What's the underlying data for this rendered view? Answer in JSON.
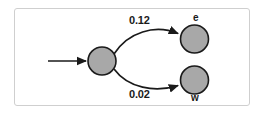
{
  "figure": {
    "title": "",
    "type": "state-transition-diagram",
    "frame": {
      "border_color": "#cfcfcf",
      "background_color": "#ffffff"
    }
  },
  "style": {
    "node_fill": "#a8a8a8",
    "node_stroke": "#1a1a1a",
    "edge_color": "#1a1a1a",
    "text_color": "#1a1a1a"
  },
  "diagram_data": {
    "nodes": [
      {
        "id": "start",
        "label": "",
        "shape": "circle",
        "cx": 102,
        "cy": 61,
        "r": 14,
        "fill": "#a8a8a8"
      },
      {
        "id": "e",
        "label": "e",
        "label_position": "above",
        "shape": "circle",
        "cx": 194.5,
        "cy": 39,
        "r": 14,
        "fill": "#a8a8a8"
      },
      {
        "id": "w",
        "label": "w",
        "label_position": "below",
        "shape": "circle",
        "cx": 194.5,
        "cy": 80,
        "r": 14,
        "fill": "#a8a8a8"
      }
    ],
    "edges": [
      {
        "id": "entry",
        "from": "",
        "to": "start",
        "label": "",
        "style": "straight-arrow"
      },
      {
        "id": "start-to-e",
        "from": "start",
        "to": "e",
        "label": "0.12",
        "label_position": "above",
        "style": "curved-arrow"
      },
      {
        "id": "start-to-w",
        "from": "start",
        "to": "w",
        "label": "0.02",
        "label_position": "below",
        "style": "curved-arrow"
      }
    ]
  }
}
